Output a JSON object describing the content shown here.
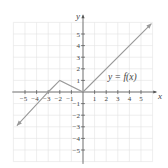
{
  "chart_data": {
    "type": "line",
    "title": "",
    "xlabel": "x",
    "ylabel": "y",
    "xlim": [
      -6,
      6
    ],
    "ylim": [
      -6,
      6
    ],
    "grid": true,
    "x_ticks": [
      -5,
      -4,
      -3,
      -2,
      -1,
      1,
      2,
      3,
      4,
      5
    ],
    "y_ticks": [
      -5,
      -4,
      -3,
      -2,
      -1,
      1,
      2,
      3,
      4,
      5
    ],
    "series": [
      {
        "name": "y = f(x)",
        "points": [
          [
            -5.7,
            -2.9
          ],
          [
            -3,
            0
          ],
          [
            -2,
            1
          ],
          [
            0,
            0
          ],
          [
            5.9,
            5.9
          ]
        ],
        "arrows": [
          "start",
          "end"
        ]
      }
    ],
    "annotations": [
      {
        "text": "y = f(x)",
        "x": 2.8,
        "y": 1.4
      }
    ]
  }
}
